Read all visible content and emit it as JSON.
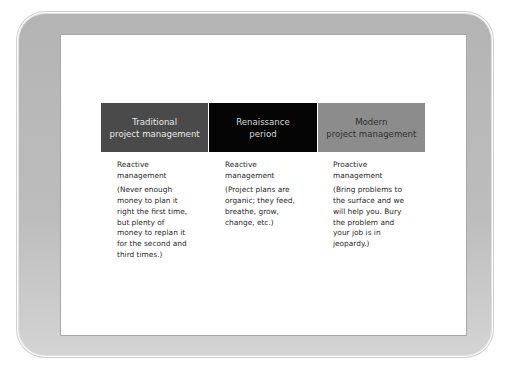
{
  "slide": {
    "columns": [
      {
        "header": "Traditional project management",
        "header_lines": [
          "Traditional",
          "project management"
        ],
        "title_lines": [
          "Reactive",
          "management"
        ],
        "body_lines": [
          "(Never enough",
          "money to plan it",
          "right the first time,",
          "but plenty of",
          "money to replan it",
          "for the second and",
          "third times.)"
        ]
      },
      {
        "header": "Renaissance period",
        "header_lines": [
          "Renaissance",
          "period"
        ],
        "title_lines": [
          "Reactive",
          "management"
        ],
        "body_lines": [
          "(Project plans are",
          "organic; they feed,",
          "breathe, grow,",
          "change, etc.)"
        ]
      },
      {
        "header": "Modern project management",
        "header_lines": [
          "Modern",
          "project management"
        ],
        "title_lines": [
          "Proactive",
          "management"
        ],
        "body_lines": [
          "(Bring problems to",
          "the surface and we",
          "will help you. Bury",
          "the problem and",
          "your job is in",
          "jeopardy.)"
        ]
      }
    ],
    "colors": {
      "header_traditional": "#4a4a4a",
      "header_renaissance": "#050505",
      "header_modern": "#8c8c8c",
      "frame": "#b8b8b8"
    }
  }
}
